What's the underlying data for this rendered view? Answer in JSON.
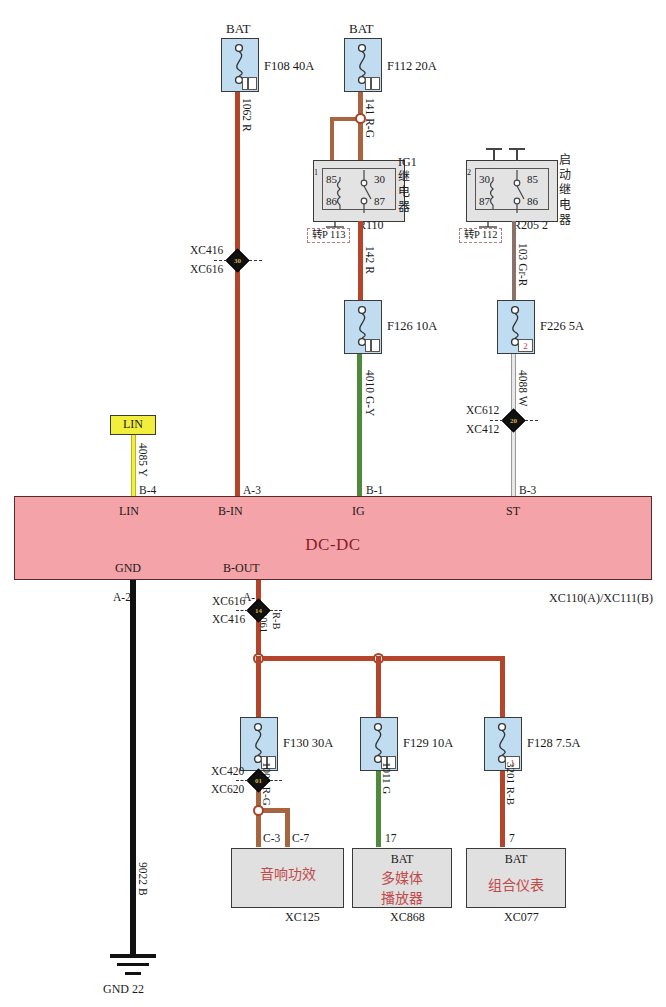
{
  "diagram": {
    "module_label": "DC-DC",
    "module_connector": "XC110(A)/XC111(B)",
    "accent_module": "#f4a3a8",
    "accent_fuse": "#bfdcf0",
    "accent_relay": "#e3e3e3",
    "accent_wire_red": "#b5452a",
    "accent_wire_green": "#4f8a3a",
    "accent_wire_yellow": "#f2ee3c",
    "accent_wire_black": "#111111",
    "accent_wire_white": "#cccccc"
  },
  "top_sources": [
    {
      "name": "bat-left",
      "label": "BAT"
    },
    {
      "name": "bat-right",
      "label": "BAT"
    }
  ],
  "fuses": [
    {
      "id": "F108",
      "label": "F108 40A",
      "tab": ""
    },
    {
      "id": "F112",
      "label": "F112 20A",
      "tab": ""
    },
    {
      "id": "F126",
      "label": "F126 10A",
      "tab": ""
    },
    {
      "id": "F226",
      "label": "F226 5A",
      "tab": "2"
    },
    {
      "id": "F130",
      "label": "F130 30A",
      "tab": ""
    },
    {
      "id": "F129",
      "label": "F129 10A",
      "tab": ""
    },
    {
      "id": "F128",
      "label": "F128 7.5A",
      "tab": "1"
    }
  ],
  "relays": [
    {
      "name": "ig1-relay",
      "title": "IG1\n继电器",
      "title_chars": [
        "I",
        "G",
        "1",
        "继",
        "电",
        "器"
      ],
      "part": "R110",
      "pins": {
        "tl": "85",
        "tr": "30",
        "bl": "86",
        "br": "87"
      },
      "ref_box": "转P 113",
      "tab": "1"
    },
    {
      "name": "starter-relay",
      "title_chars": [
        "启",
        "动",
        "继",
        "电",
        "器"
      ],
      "part": "R205  2",
      "pins": {
        "tl": "30",
        "tr": "85",
        "bl": "87",
        "br": "86"
      },
      "ref_box": "转P 112",
      "tab": "2"
    }
  ],
  "wires": [
    {
      "name": "wire-1062",
      "label": "1062 R",
      "color": "#b5452a"
    },
    {
      "name": "wire-141",
      "label": "141 R-G",
      "color": "#b5452a"
    },
    {
      "name": "wire-142",
      "label": "142 R",
      "color": "#b5452a"
    },
    {
      "name": "wire-103",
      "label": "103 Gr-R",
      "color": "#8a7268"
    },
    {
      "name": "wire-4010",
      "label": "4010 G-Y",
      "color": "#4f8a3a"
    },
    {
      "name": "wire-4088",
      "label": "4088 W",
      "color": "#cccccc"
    },
    {
      "name": "wire-4085",
      "label": "4085 Y",
      "color": "#f2ee3c"
    },
    {
      "name": "wire-1061",
      "label": "1061\nR-B",
      "color": "#b5452a"
    },
    {
      "name": "wire-1001",
      "label": "1001 R-G",
      "color": "#a8643f"
    },
    {
      "name": "wire-1011",
      "label": "1011 G",
      "color": "#4f8a3a"
    },
    {
      "name": "wire-3201",
      "label": "3201 R-B",
      "color": "#b5452a"
    },
    {
      "name": "wire-9022",
      "label": "9022 B",
      "color": "#111111"
    }
  ],
  "wire_labels": {
    "w1062": "1062 R",
    "w141": "141 R-G",
    "w142": "142 R",
    "w103": "103 Gr-R",
    "w4010": "4010 G-Y",
    "w4088": "4088 W",
    "w4085": "4085 Y",
    "w1061a": "1061",
    "w1061b": "R-B",
    "w1001": "1001 R-G",
    "w1011": "1011 G",
    "w3201": "3201 R-B",
    "w9022": "9022 B"
  },
  "connectors": [
    {
      "name": "conn-xc416-xc616",
      "top": "XC416",
      "bottom": "XC616",
      "num": "30"
    },
    {
      "name": "conn-xc612-xc412",
      "top": "XC612",
      "bottom": "XC412",
      "num": "20"
    },
    {
      "name": "conn-xc616-xc416",
      "top": "XC616",
      "bottom": "XC416",
      "num": "14"
    },
    {
      "name": "conn-xc420-xc620",
      "top": "XC420",
      "bottom": "XC620",
      "num": "01"
    }
  ],
  "module_pins_top": [
    {
      "name": "pin-lin",
      "pin": "B-4",
      "fn": "LIN"
    },
    {
      "name": "pin-bin",
      "pin": "A-3",
      "fn": "B-IN"
    },
    {
      "name": "pin-ig",
      "pin": "B-1",
      "fn": "IG"
    },
    {
      "name": "pin-st",
      "pin": "B-3",
      "fn": "ST"
    }
  ],
  "module_pins_bottom": [
    {
      "name": "pin-gnd",
      "fn": "GND",
      "pin": "A-2"
    },
    {
      "name": "pin-bout",
      "fn": "B-OUT",
      "pin": "A-1"
    }
  ],
  "components": [
    {
      "name": "audio-amplifier",
      "bat": "",
      "title_lines": [
        "音响功效"
      ],
      "connector": "XC125",
      "pins": [
        "C-3",
        "C-7"
      ]
    },
    {
      "name": "multimedia-player",
      "bat": "BAT",
      "title_lines": [
        "多媒体",
        "播放器"
      ],
      "connector": "XC868",
      "pins": [
        "17"
      ]
    },
    {
      "name": "instrument-cluster",
      "bat": "BAT",
      "title_lines": [
        "组合仪表"
      ],
      "connector": "XC077",
      "pins": [
        "7"
      ]
    }
  ],
  "lin_node": {
    "label": "LIN"
  },
  "ground": {
    "label": "GND 22",
    "wire": "9022 B"
  }
}
